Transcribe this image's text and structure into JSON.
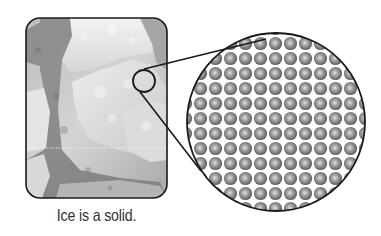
{
  "figure": {
    "caption": "Ice is a solid.",
    "photo": {
      "subject": "ice-blocks-photo",
      "tone": "grayscale"
    },
    "magnifier": {
      "description": "magnified view showing tightly packed particles in a regular grid",
      "particle_icon": "sphere-icon",
      "grid_pitch_px": 15
    },
    "colors": {
      "outline": "#1a1a1a",
      "particle_dark": "#6e6e6e",
      "particle_light": "#d9d9d9",
      "caption_text": "#333333"
    }
  }
}
